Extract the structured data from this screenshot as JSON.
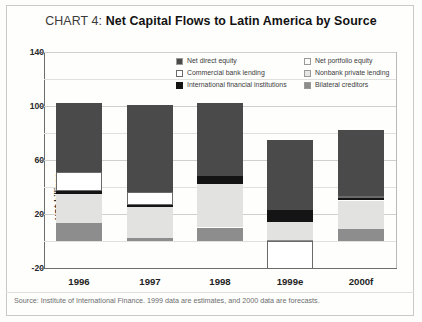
{
  "title": {
    "prefix": "CHART 4: ",
    "main": "Net Capital Flows to Latin America by Source"
  },
  "chart_data": {
    "type": "bar",
    "stacked": true,
    "title": "CHART 4: Net Capital Flows to Latin America by Source",
    "xlabel": "",
    "ylabel": "US$ billions",
    "ylim": [
      -20,
      140
    ],
    "yticks": [
      -20,
      20,
      60,
      100,
      140
    ],
    "ytick_labels": [
      "-20",
      "20",
      "60",
      "100",
      "140"
    ],
    "minor_yticks": [
      0,
      40,
      80,
      120
    ],
    "grid": true,
    "legend_position": "inside-top",
    "categories": [
      "1996",
      "1997",
      "1998",
      "1999e",
      "2000f"
    ],
    "series": [
      {
        "name": "Bilateral creditors",
        "color": "#8d8d8d",
        "values": [
          13,
          2,
          10,
          1,
          9
        ]
      },
      {
        "name": "Nonbank private lending",
        "color": "#e2e2e0",
        "values": [
          22,
          23,
          32,
          13,
          21
        ]
      },
      {
        "name": "International financial institutions",
        "color": "#141414",
        "values": [
          2,
          2,
          6,
          9,
          2
        ]
      },
      {
        "name": "Commercial bank lending",
        "color": "#ffffff",
        "values": [
          14,
          9,
          0,
          -21,
          1
        ]
      },
      {
        "name": "Net direct equity",
        "color": "#4a4a4a",
        "values": [
          51,
          65,
          54,
          52,
          49
        ]
      },
      {
        "name": "Net portfolio equity",
        "color": "#f2f2f0",
        "values": [
          0,
          0,
          0,
          0,
          0
        ]
      }
    ],
    "totals": [
      102,
      101,
      102,
      75,
      82
    ]
  },
  "yaxis": {
    "label": "US$ billions",
    "ticks": [
      "140",
      "100",
      "60",
      "20",
      "-20"
    ]
  },
  "xaxis": {
    "ticks": [
      "1996",
      "1997",
      "1998",
      "1999e",
      "2000f"
    ]
  },
  "legend": {
    "left": [
      {
        "label": "Net direct equity",
        "color": "#4a4a4a"
      },
      {
        "label": "Commercial bank lending",
        "color": "#ffffff"
      },
      {
        "label": "International financial institutions",
        "color": "#141414"
      }
    ],
    "right": [
      {
        "label": "Net portfolio equity",
        "color": "#fbfbfa"
      },
      {
        "label": "Nonbank private lending",
        "color": "#e6e6e4"
      },
      {
        "label": "Bilateral creditors",
        "color": "#8d8d8d"
      }
    ]
  },
  "source": {
    "text": "Source: Institute of International Finance. 1999 data are estimates, and 2000 data are forecasts."
  }
}
